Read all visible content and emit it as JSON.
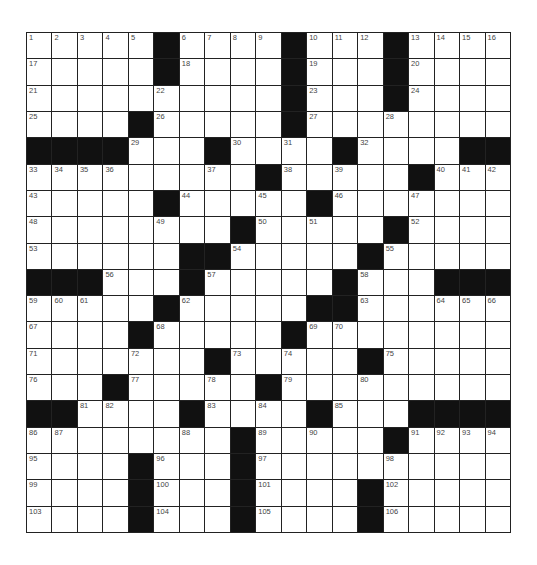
{
  "puzzle": {
    "rows": 19,
    "cols": 19,
    "colors": {
      "block": "#111111",
      "cell": "#ffffff",
      "line": "#222222",
      "number": "#444444"
    },
    "grid": [
      [
        1,
        2,
        3,
        4,
        5,
        "#",
        6,
        7,
        8,
        9,
        "#",
        10,
        11,
        12,
        "#",
        13,
        14,
        15,
        16
      ],
      [
        17,
        "",
        "",
        "",
        "",
        "#",
        18,
        "",
        "",
        "",
        "#",
        19,
        "",
        "",
        "#",
        20,
        "",
        "",
        ""
      ],
      [
        21,
        "",
        "",
        "",
        "",
        22,
        "",
        "",
        "",
        "",
        "#",
        23,
        "",
        "",
        "#",
        24,
        "",
        "",
        ""
      ],
      [
        25,
        "",
        "",
        "",
        "#",
        26,
        "",
        "",
        "",
        "",
        "#",
        27,
        "",
        "",
        28,
        "",
        "",
        "",
        ""
      ],
      [
        "#",
        "#",
        "#",
        "#",
        29,
        "",
        "",
        "#",
        30,
        "",
        31,
        "",
        "#",
        32,
        "",
        "",
        "",
        "#",
        "#"
      ],
      [
        33,
        34,
        35,
        36,
        "",
        "",
        "",
        37,
        "",
        "#",
        38,
        "",
        39,
        "",
        "",
        "#",
        40,
        41,
        42
      ],
      [
        43,
        "",
        "",
        "",
        "",
        "#",
        44,
        "",
        "",
        45,
        "",
        "#",
        46,
        "",
        "",
        47,
        "",
        "",
        ""
      ],
      [
        48,
        "",
        "",
        "",
        "",
        49,
        "",
        "",
        "#",
        50,
        "",
        51,
        "",
        "",
        "#",
        52,
        "",
        "",
        ""
      ],
      [
        53,
        "",
        "",
        "",
        "",
        "",
        "#",
        "#",
        54,
        "",
        "",
        "",
        "",
        "#",
        55,
        "",
        "",
        "",
        ""
      ],
      [
        "#",
        "#",
        "#",
        56,
        "",
        "",
        "#",
        57,
        "",
        "",
        "",
        "",
        "#",
        58,
        "",
        "",
        "#",
        "#",
        "#"
      ],
      [
        59,
        60,
        61,
        "",
        "",
        "#",
        62,
        "",
        "",
        "",
        "",
        "#",
        "#",
        63,
        "",
        "",
        64,
        65,
        66
      ],
      [
        67,
        "",
        "",
        "",
        "#",
        68,
        "",
        "",
        "",
        "",
        "#",
        69,
        70,
        "",
        "",
        "",
        "",
        "",
        ""
      ],
      [
        71,
        "",
        "",
        "",
        72,
        "",
        "",
        "#",
        73,
        "",
        74,
        "",
        "",
        "#",
        75,
        "",
        "",
        "",
        ""
      ],
      [
        76,
        "",
        "",
        "#",
        77,
        "",
        "",
        78,
        "",
        "#",
        79,
        "",
        "",
        80,
        "",
        "",
        "",
        "",
        ""
      ],
      [
        "#",
        "#",
        81,
        82,
        "",
        "",
        "#",
        83,
        "",
        84,
        "",
        "#",
        85,
        "",
        "",
        "#",
        "#",
        "#",
        "#"
      ],
      [
        86,
        87,
        "",
        "",
        "",
        "",
        88,
        "",
        "#",
        89,
        "",
        90,
        "",
        "",
        "#",
        91,
        92,
        93,
        94
      ],
      [
        95,
        "",
        "",
        "",
        "#",
        96,
        "",
        "",
        "#",
        97,
        "",
        "",
        "",
        "",
        98,
        "",
        "",
        "",
        ""
      ],
      [
        99,
        "",
        "",
        "",
        "#",
        100,
        "",
        "",
        "#",
        101,
        "",
        "",
        "",
        "#",
        102,
        "",
        "",
        "",
        ""
      ],
      [
        103,
        "",
        "",
        "",
        "#",
        104,
        "",
        "",
        "#",
        105,
        "",
        "",
        "",
        "#",
        106,
        "",
        "",
        "",
        ""
      ]
    ]
  }
}
